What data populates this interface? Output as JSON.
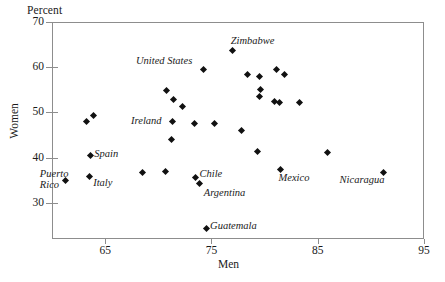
{
  "chart_data": {
    "type": "scatter",
    "title": "",
    "unit_label": "Percent",
    "xlabel": "Men",
    "ylabel": "Women",
    "xlim": [
      60,
      95
    ],
    "ylim": [
      22,
      70
    ],
    "xticks": [
      65,
      75,
      85,
      95
    ],
    "yticks": [
      30,
      40,
      50,
      60,
      70
    ],
    "grid": false,
    "legend": "none",
    "points": [
      {
        "x": 63.2,
        "y": 48.0,
        "label": ""
      },
      {
        "x": 63.9,
        "y": 49.3,
        "label": ""
      },
      {
        "x": 63.6,
        "y": 40.4,
        "label": "Spain"
      },
      {
        "x": 63.5,
        "y": 35.8,
        "label": "Italy"
      },
      {
        "x": 61.3,
        "y": 35.0,
        "label": "Puerto Rico"
      },
      {
        "x": 70.8,
        "y": 54.8,
        "label": ""
      },
      {
        "x": 71.4,
        "y": 52.8,
        "label": ""
      },
      {
        "x": 72.3,
        "y": 51.2,
        "label": ""
      },
      {
        "x": 71.3,
        "y": 48.1,
        "label": "Ireland"
      },
      {
        "x": 71.2,
        "y": 44.0,
        "label": ""
      },
      {
        "x": 70.7,
        "y": 37.0,
        "label": ""
      },
      {
        "x": 74.3,
        "y": 59.6,
        "label": "United States"
      },
      {
        "x": 73.4,
        "y": 47.5,
        "label": ""
      },
      {
        "x": 75.3,
        "y": 47.6,
        "label": ""
      },
      {
        "x": 73.5,
        "y": 35.7,
        "label": "Chile"
      },
      {
        "x": 73.9,
        "y": 34.2,
        "label": "Argentina"
      },
      {
        "x": 74.5,
        "y": 24.4,
        "label": "Guatemala"
      },
      {
        "x": 77.0,
        "y": 63.7,
        "label": "Zimbabwe"
      },
      {
        "x": 78.4,
        "y": 58.4,
        "label": ""
      },
      {
        "x": 79.5,
        "y": 58.0,
        "label": ""
      },
      {
        "x": 81.1,
        "y": 59.4,
        "label": ""
      },
      {
        "x": 81.9,
        "y": 58.4,
        "label": ""
      },
      {
        "x": 79.6,
        "y": 55.0,
        "label": ""
      },
      {
        "x": 79.5,
        "y": 53.6,
        "label": ""
      },
      {
        "x": 80.9,
        "y": 52.4,
        "label": ""
      },
      {
        "x": 81.4,
        "y": 52.3,
        "label": ""
      },
      {
        "x": 83.3,
        "y": 52.3,
        "label": ""
      },
      {
        "x": 77.8,
        "y": 46.0,
        "label": ""
      },
      {
        "x": 85.9,
        "y": 41.2,
        "label": ""
      },
      {
        "x": 79.3,
        "y": 41.4,
        "label": ""
      },
      {
        "x": 81.5,
        "y": 37.4,
        "label": "Mexico"
      },
      {
        "x": 91.2,
        "y": 36.6,
        "label": "Nicaragua"
      },
      {
        "x": 68.5,
        "y": 36.8,
        "label": ""
      }
    ],
    "annotations": [
      {
        "text": "Percent",
        "role": "unit"
      },
      {
        "text": "Women",
        "role": "y-axis-title"
      },
      {
        "text": "Men",
        "role": "x-axis-title"
      },
      {
        "text": "Zimbabwe",
        "role": "point-label"
      },
      {
        "text": "United States",
        "role": "point-label"
      },
      {
        "text": "Ireland",
        "role": "point-label"
      },
      {
        "text": "Spain",
        "role": "point-label"
      },
      {
        "text": "Italy",
        "role": "point-label"
      },
      {
        "text": "Puerto\nRico",
        "role": "point-label"
      },
      {
        "text": "Chile",
        "role": "point-label"
      },
      {
        "text": "Argentina",
        "role": "point-label"
      },
      {
        "text": "Guatemala",
        "role": "point-label"
      },
      {
        "text": "Mexico",
        "role": "point-label"
      },
      {
        "text": "Nicaragua",
        "role": "point-label"
      }
    ],
    "marker": {
      "shape": "diamond",
      "color": "#111111",
      "size_px": 5
    },
    "frame_color": "#8d8d8d"
  },
  "labels": {
    "percent": "Percent",
    "women": "Women",
    "men": "Men"
  },
  "yticks": [
    {
      "value": 70,
      "text": "70"
    },
    {
      "value": 60,
      "text": "60"
    },
    {
      "value": 50,
      "text": "50"
    },
    {
      "value": 40,
      "text": "40"
    },
    {
      "value": 30,
      "text": "30"
    }
  ],
  "xticks": [
    {
      "value": 65,
      "text": "65"
    },
    {
      "value": 75,
      "text": "75"
    },
    {
      "value": 85,
      "text": "85"
    },
    {
      "value": 95,
      "text": "95"
    }
  ],
  "point_labels": [
    {
      "text": "Zimbabwe",
      "x": 77.0,
      "y": 63.7,
      "dx": -2,
      "dy": -15
    },
    {
      "text": "United States",
      "x": 74.3,
      "y": 59.6,
      "dx": -68,
      "dy": -14
    },
    {
      "text": "Ireland",
      "x": 71.3,
      "y": 48.1,
      "dx": -41,
      "dy": -6
    },
    {
      "text": "Spain",
      "x": 63.6,
      "y": 40.4,
      "dx": 4,
      "dy": -8
    },
    {
      "text": "Italy",
      "x": 63.5,
      "y": 35.8,
      "dx": 4,
      "dy": 0
    },
    {
      "text": "Puerto",
      "x": 61.3,
      "y": 35.0,
      "dx": -26,
      "dy": -12
    },
    {
      "text": "Rico",
      "x": 61.3,
      "y": 35.0,
      "dx": -26,
      "dy": -1
    },
    {
      "text": "Chile",
      "x": 73.5,
      "y": 35.7,
      "dx": 4,
      "dy": -9
    },
    {
      "text": "Argentina",
      "x": 73.9,
      "y": 34.2,
      "dx": 4,
      "dy": 3
    },
    {
      "text": "Guatemala",
      "x": 74.5,
      "y": 24.4,
      "dx": 4,
      "dy": -8
    },
    {
      "text": "Mexico",
      "x": 81.5,
      "y": 37.4,
      "dx": -2,
      "dy": 3
    },
    {
      "text": "Nicaragua",
      "x": 91.2,
      "y": 36.6,
      "dx": -44,
      "dy": 1
    }
  ]
}
